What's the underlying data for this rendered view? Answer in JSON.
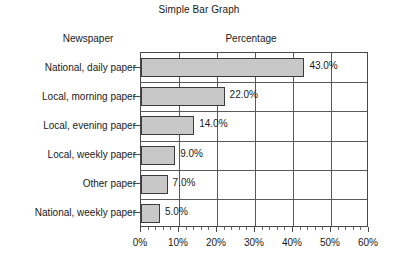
{
  "chart_data": {
    "type": "bar",
    "orientation": "horizontal",
    "title": "Simple Bar Graph",
    "xlabel": "Percentage",
    "ylabel": "Newspaper",
    "categories": [
      "National, daily paper",
      "Local, morning paper",
      "Local, evening paper",
      "Local, weekly paper",
      "Other paper",
      "National, weekly paper"
    ],
    "values": [
      43.0,
      22.0,
      14.0,
      9.0,
      7.0,
      5.0
    ],
    "value_labels": [
      "43.0%",
      "22.0%",
      "14.0%",
      "9.0%",
      "7.0%",
      "5.0%"
    ],
    "xlim": [
      0,
      60
    ],
    "xticks": [
      0,
      10,
      20,
      30,
      40,
      50,
      60
    ],
    "xtick_labels": [
      "0%",
      "10%",
      "20%",
      "30%",
      "40%",
      "50%",
      "60%"
    ],
    "grid": true,
    "legend": false,
    "bar_color": "#c8c8c8",
    "bar_border_color": "#3c3c3c",
    "axis_color": "#4a4a4a",
    "background": "#ffffff"
  }
}
